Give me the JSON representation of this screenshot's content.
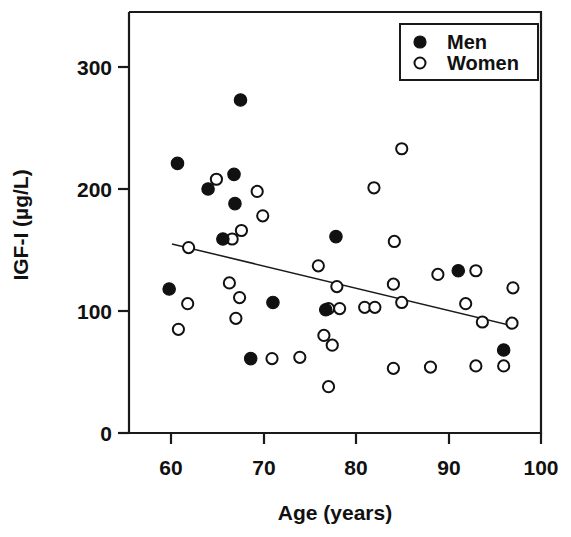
{
  "chart_data": {
    "type": "scatter",
    "title": "",
    "xlabel": "Age (years)",
    "ylabel": "IGF-I (µg/L)",
    "xlim": [
      55,
      100
    ],
    "ylim": [
      0,
      340
    ],
    "xticks": [
      60,
      70,
      80,
      90,
      100
    ],
    "yticks": [
      0,
      100,
      200,
      300
    ],
    "xtick_labels": [
      "60",
      "70",
      "80",
      "90",
      "100"
    ],
    "ytick_labels": [
      "0",
      "100",
      "200",
      "300"
    ],
    "grid": false,
    "legend_position": "top-right",
    "legend": [
      {
        "name": "Men",
        "marker": "filled-circle"
      },
      {
        "name": "Women",
        "marker": "open-circle"
      }
    ],
    "series": [
      {
        "name": "Men",
        "marker": "filled-circle",
        "points": [
          [
            67.5,
            273
          ],
          [
            60.7,
            221
          ],
          [
            66.8,
            212
          ],
          [
            64.0,
            200
          ],
          [
            66.9,
            188
          ],
          [
            65.6,
            159
          ],
          [
            77.8,
            161
          ],
          [
            91.0,
            133
          ],
          [
            59.8,
            118
          ],
          [
            71.0,
            107
          ],
          [
            76.7,
            101
          ],
          [
            68.6,
            61
          ],
          [
            95.9,
            68
          ]
        ]
      },
      {
        "name": "Women",
        "marker": "open-circle",
        "points": [
          [
            84.9,
            233
          ],
          [
            64.9,
            208
          ],
          [
            81.9,
            201
          ],
          [
            69.3,
            198
          ],
          [
            69.9,
            178
          ],
          [
            67.6,
            166
          ],
          [
            66.6,
            159
          ],
          [
            84.1,
            157
          ],
          [
            61.9,
            152
          ],
          [
            75.9,
            137
          ],
          [
            92.9,
            133
          ],
          [
            88.8,
            130
          ],
          [
            66.3,
            123
          ],
          [
            84.0,
            122
          ],
          [
            77.9,
            120
          ],
          [
            96.9,
            119
          ],
          [
            67.4,
            111
          ],
          [
            61.8,
            106
          ],
          [
            91.8,
            106
          ],
          [
            84.9,
            107
          ],
          [
            80.9,
            103
          ],
          [
            82.0,
            103
          ],
          [
            78.2,
            102
          ],
          [
            77.0,
            102
          ],
          [
            93.6,
            91
          ],
          [
            67.0,
            94
          ],
          [
            60.8,
            85
          ],
          [
            76.5,
            80
          ],
          [
            77.4,
            72
          ],
          [
            73.9,
            62
          ],
          [
            70.9,
            61
          ],
          [
            84.0,
            53
          ],
          [
            88.0,
            54
          ],
          [
            92.9,
            55
          ],
          [
            95.9,
            55
          ],
          [
            96.8,
            90
          ],
          [
            77.0,
            38
          ]
        ]
      }
    ],
    "trend_line": {
      "label": "regression line",
      "x_start": 60.1,
      "y_start": 155,
      "x_end": 97.3,
      "y_end": 87
    }
  },
  "axes": {
    "x_title": "Age (years)",
    "y_title": "IGF-I (µg/L)"
  }
}
